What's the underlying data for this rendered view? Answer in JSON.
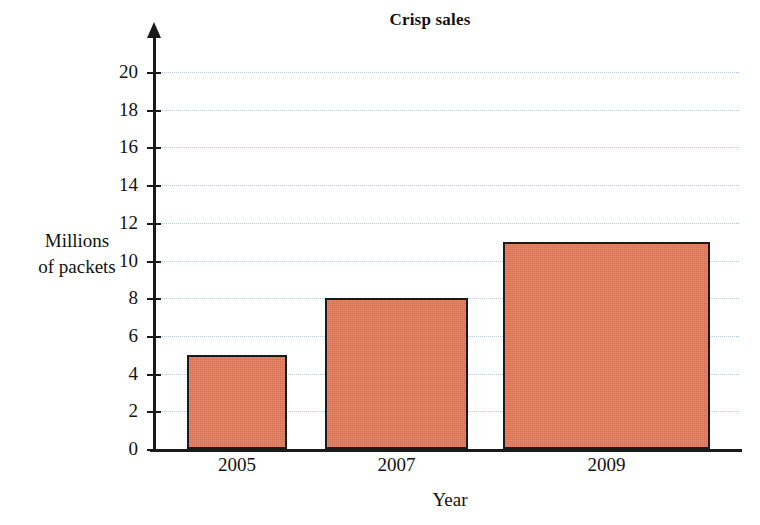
{
  "chart_data": {
    "type": "bar",
    "title": "Crisp sales",
    "xlabel": "Year",
    "ylabel": "Millions of packets",
    "ylabel_line1": "Millions",
    "ylabel_line2": "of packets",
    "categories": [
      "2005",
      "2007",
      "2009"
    ],
    "values": [
      5,
      8,
      11
    ],
    "series": [
      {
        "name": "Crisp sales",
        "values": [
          5,
          8,
          11
        ]
      }
    ],
    "ylim": [
      0,
      20
    ],
    "ytick_step": 2,
    "yticks": [
      "0",
      "2",
      "4",
      "6",
      "8",
      "10",
      "12",
      "14",
      "16",
      "18",
      "20"
    ],
    "grid": "horizontal-dotted",
    "legend": "none",
    "colors": {
      "bar_fill": "#e3795a",
      "bar_stroke": "#1a1a1a",
      "gridline": "#a9cfe9",
      "axis": "#1a1a1a",
      "background": "#ffffff",
      "text": "#111111"
    }
  }
}
